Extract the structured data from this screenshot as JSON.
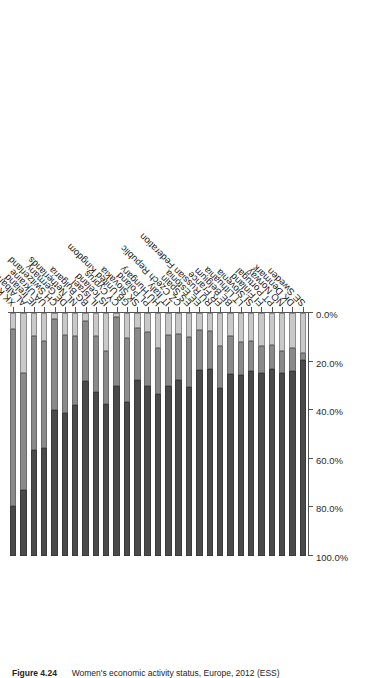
{
  "figure": {
    "number_label": "Figure 4.24",
    "caption": "Women's economic activity status, Europe, 2012 (ESS)"
  },
  "chart_data": {
    "type": "bar",
    "orientation": "horizontal-stacked",
    "title": "Women's economic activity status, Europe, 2012 (ESS)",
    "xlabel": "",
    "ylabel": "",
    "xlim": [
      0,
      100
    ],
    "grid": false,
    "legend_position": "none",
    "axis_tick_labels": [
      "100.0%",
      "80.0%",
      "60.0%",
      "40.0%",
      "20.0%",
      "0.0%"
    ],
    "axis_tick_values": [
      100,
      80,
      60,
      40,
      20,
      0
    ],
    "axis_direction": "reversed",
    "series": [
      {
        "name": "segment-1",
        "color": "#c9c9c9"
      },
      {
        "name": "segment-2",
        "color": "#8a8a8a"
      },
      {
        "name": "segment-3",
        "color": "#4a4a4a"
      }
    ],
    "categories": [
      "XK Kosovo",
      "AL Albania",
      "IE Ireland",
      "UA Ukraine",
      "CH Switzerland",
      "DE Germany",
      "NL Netherlands",
      "BG Bulgaria",
      "IL Israel",
      "IS Iceland",
      "CY Cyprus",
      "GB United Kingdom",
      "SK Slovakia",
      "PL Poland",
      "HU Hungary",
      "IT Italy",
      "CZ Czech Republic",
      "ES Spain",
      "EE Estonia",
      "RU Russian Federation",
      "FR France",
      "BE Belgium",
      "LT Lithuania",
      "SI Slovenia",
      "FI Finland",
      "PT Portugal",
      "NO Norway",
      "DK Denmark",
      "SE Sweden"
    ],
    "rows": [
      {
        "category": "XK Kosovo",
        "values": [
          6.5,
          73.0,
          20.5
        ]
      },
      {
        "category": "AL Albania",
        "values": [
          24.5,
          48.5,
          27.0
        ]
      },
      {
        "category": "IE Ireland",
        "values": [
          9.5,
          47.0,
          43.5
        ]
      },
      {
        "category": "UA Ukraine",
        "values": [
          11.5,
          44.0,
          44.5
        ]
      },
      {
        "category": "CH Switzerland",
        "values": [
          2.5,
          37.5,
          60.0
        ]
      },
      {
        "category": "DE Germany",
        "values": [
          9.0,
          32.0,
          59.0
        ]
      },
      {
        "category": "NL Netherlands",
        "values": [
          9.5,
          28.5,
          62.0
        ]
      },
      {
        "category": "BG Bulgaria",
        "values": [
          3.5,
          24.5,
          72.0
        ]
      },
      {
        "category": "IL Israel",
        "values": [
          9.5,
          23.0,
          67.5
        ]
      },
      {
        "category": "IS Iceland",
        "values": [
          15.5,
          22.0,
          62.5
        ]
      },
      {
        "category": "CY Cyprus",
        "values": [
          1.5,
          28.5,
          70.0
        ]
      },
      {
        "category": "GB United Kingdom",
        "values": [
          10.5,
          26.0,
          63.5
        ]
      },
      {
        "category": "SK Slovakia",
        "values": [
          6.0,
          21.5,
          72.5
        ]
      },
      {
        "category": "PL Poland",
        "values": [
          8.0,
          22.0,
          70.0
        ]
      },
      {
        "category": "HU Hungary",
        "values": [
          14.5,
          19.0,
          66.5
        ]
      },
      {
        "category": "IT Italy",
        "values": [
          9.0,
          21.0,
          70.0
        ]
      },
      {
        "category": "CZ Czech Republic",
        "values": [
          8.5,
          19.0,
          72.5
        ]
      },
      {
        "category": "ES Spain",
        "values": [
          10.0,
          20.5,
          69.5
        ]
      },
      {
        "category": "EE Estonia",
        "values": [
          7.0,
          16.5,
          76.5
        ]
      },
      {
        "category": "RU Russian Federation",
        "values": [
          7.5,
          15.5,
          77.0
        ]
      },
      {
        "category": "FR France",
        "values": [
          13.5,
          17.5,
          69.0
        ]
      },
      {
        "category": "BE Belgium",
        "values": [
          9.5,
          15.5,
          75.0
        ]
      },
      {
        "category": "LT Lithuania",
        "values": [
          12.0,
          13.5,
          74.5
        ]
      },
      {
        "category": "SI Slovenia",
        "values": [
          11.5,
          12.5,
          76.0
        ]
      },
      {
        "category": "FI Finland",
        "values": [
          13.5,
          11.0,
          75.5
        ]
      },
      {
        "category": "PT Portugal",
        "values": [
          13.0,
          10.0,
          77.0
        ]
      },
      {
        "category": "NO Norway",
        "values": [
          15.5,
          9.0,
          75.5
        ]
      },
      {
        "category": "DK Denmark",
        "values": [
          14.5,
          9.5,
          76.0
        ]
      },
      {
        "category": "SE Sweden",
        "values": [
          16.5,
          3.0,
          80.5
        ]
      }
    ]
  }
}
